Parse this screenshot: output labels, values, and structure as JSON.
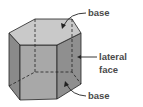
{
  "diagram": {
    "labels": {
      "top_base": "base",
      "lateral_line1": "lateral",
      "lateral_line2": "face",
      "bottom_base": "base"
    },
    "colors": {
      "top_face": "#c9c9c9",
      "front_face": "#a8a8a8",
      "left_face": "#8a8a8a",
      "right_face": "#8f8f8f",
      "edge": "#222222",
      "label": "#4a4a4a"
    }
  }
}
